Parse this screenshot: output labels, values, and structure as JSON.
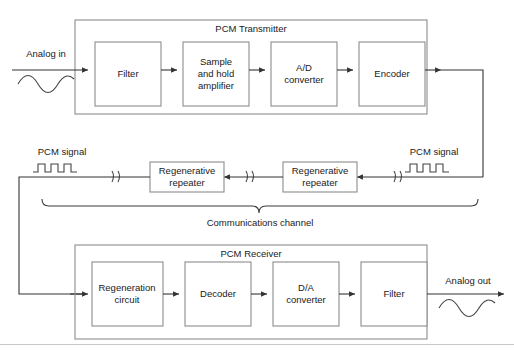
{
  "diagram": {
    "transmitter": {
      "group_label": "PCM Transmitter",
      "blocks": [
        {
          "id": "filter-tx",
          "lines": [
            "Filter"
          ]
        },
        {
          "id": "sample-hold",
          "lines": [
            "Sample",
            "and hold",
            "amplifier"
          ]
        },
        {
          "id": "ad-converter",
          "lines": [
            "A/D",
            "converter"
          ]
        },
        {
          "id": "encoder",
          "lines": [
            "Encoder"
          ]
        }
      ]
    },
    "receiver": {
      "group_label": "PCM Receiver",
      "blocks": [
        {
          "id": "regeneration-circuit",
          "lines": [
            "Regeneration",
            "circuit"
          ]
        },
        {
          "id": "decoder",
          "lines": [
            "Decoder"
          ]
        },
        {
          "id": "da-converter",
          "lines": [
            "D/A",
            "converter"
          ]
        },
        {
          "id": "filter-rx",
          "lines": [
            "Filter"
          ]
        }
      ]
    },
    "channel": {
      "label": "Communications channel",
      "repeaters": [
        {
          "id": "repeater-left",
          "lines": [
            "Regenerative",
            "repeater"
          ]
        },
        {
          "id": "repeater-right",
          "lines": [
            "Regenerative",
            "repeater"
          ]
        }
      ],
      "signal_label_left": "PCM signal",
      "signal_label_right": "PCM signal"
    },
    "io": {
      "analog_in": "Analog in",
      "analog_out": "Analog out"
    },
    "colors": {
      "box_border": "#8c8c8c",
      "wire": "#333333",
      "text": "#1a1a1a",
      "background": "#ffffff"
    }
  }
}
